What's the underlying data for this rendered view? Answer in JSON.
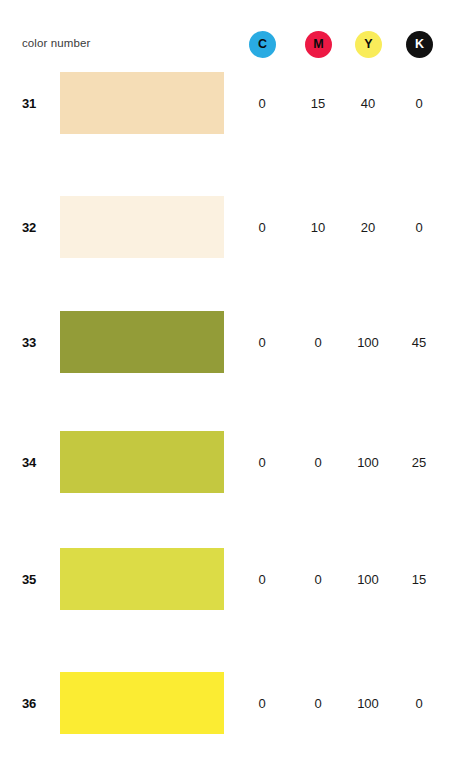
{
  "header": {
    "label": "color number",
    "inks": [
      {
        "letter": "C",
        "name": "cyan",
        "bg": "#29abe2",
        "fg": "#0a0a0a",
        "x": 249
      },
      {
        "letter": "M",
        "name": "magenta",
        "bg": "#ed1944",
        "fg": "#0a0a0a",
        "x": 305
      },
      {
        "letter": "Y",
        "name": "yellow",
        "bg": "#f9ec5a",
        "fg": "#0a0a0a",
        "x": 355
      },
      {
        "letter": "K",
        "name": "black",
        "bg": "#111111",
        "fg": "#ffffff",
        "x": 406
      }
    ]
  },
  "columns": {
    "x": [
      239,
      295,
      345,
      396
    ]
  },
  "rows": [
    {
      "number": "31",
      "swatch": "#f5ddb6",
      "y": 72,
      "values": [
        "0",
        "15",
        "40",
        "0"
      ]
    },
    {
      "number": "32",
      "swatch": "#fbf1e0",
      "y": 196,
      "values": [
        "0",
        "10",
        "20",
        "0"
      ]
    },
    {
      "number": "33",
      "swatch": "#939c38",
      "y": 311,
      "values": [
        "0",
        "0",
        "100",
        "45"
      ]
    },
    {
      "number": "34",
      "swatch": "#c4c840",
      "y": 431,
      "values": [
        "0",
        "0",
        "100",
        "25"
      ]
    },
    {
      "number": "35",
      "swatch": "#dcdc46",
      "y": 548,
      "values": [
        "0",
        "0",
        "100",
        "15"
      ]
    },
    {
      "number": "36",
      "swatch": "#fbec33",
      "y": 672,
      "values": [
        "0",
        "0",
        "100",
        "0"
      ]
    }
  ]
}
